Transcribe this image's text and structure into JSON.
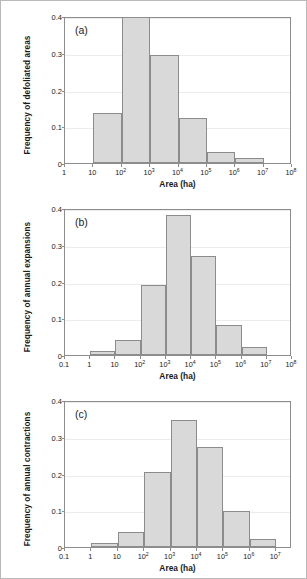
{
  "figure": {
    "background": "#ffffff",
    "frame_color": "#b9b9b9",
    "bar_fill": "#d9d9d9",
    "bar_stroke": "#8c8c8c",
    "axis_color": "#8d8d8d",
    "grid_color": "#ececec"
  },
  "chart_data": [
    {
      "type": "bar",
      "panel": "(a)",
      "title": "",
      "xlabel": "Area (ha)",
      "ylabel": "Frequency of defoliated areas",
      "xscale": "log",
      "xtick_labels": [
        "1",
        "10",
        "10²",
        "10³",
        "10⁴",
        "10⁵",
        "10⁶",
        "10⁷",
        "10⁸"
      ],
      "xtick_bases": [
        "1",
        "10",
        "10",
        "10",
        "10",
        "10",
        "10",
        "10",
        "10"
      ],
      "xtick_exponents": [
        "",
        "",
        "2",
        "3",
        "4",
        "5",
        "6",
        "7",
        "8"
      ],
      "xtick_values": [
        0,
        1,
        2,
        3,
        4,
        5,
        6,
        7,
        8
      ],
      "xlim_exp": [
        0,
        8
      ],
      "ytick_labels": [
        "0",
        "0.1",
        "0.2",
        "0.3",
        "0.4"
      ],
      "ytick_values": [
        0,
        0.1,
        0.2,
        0.3,
        0.4
      ],
      "ylim": [
        0,
        0.4
      ],
      "grid": true,
      "legend": "none",
      "bins_exp": [
        [
          1,
          2
        ],
        [
          2,
          3
        ],
        [
          3,
          4
        ],
        [
          4,
          5
        ],
        [
          5,
          6
        ],
        [
          6,
          7
        ]
      ],
      "bin_labels": [
        "10–10²",
        "10²–10³",
        "10³–10⁴",
        "10⁴–10⁵",
        "10⁵–10⁶",
        "10⁶–10⁷"
      ],
      "values": [
        0.135,
        0.4,
        0.293,
        0.123,
        0.031,
        0.013
      ]
    },
    {
      "type": "bar",
      "panel": "(b)",
      "title": "",
      "xlabel": "Area (ha)",
      "ylabel": "Frequency of annual expansions",
      "xscale": "log",
      "xtick_labels": [
        "0.1",
        "1",
        "10",
        "10²",
        "10³",
        "10⁴",
        "10⁵",
        "10⁶",
        "10⁷",
        "10⁸"
      ],
      "xtick_bases": [
        "0.1",
        "1",
        "10",
        "10",
        "10",
        "10",
        "10",
        "10",
        "10",
        "10"
      ],
      "xtick_exponents": [
        "",
        "",
        "",
        "2",
        "3",
        "4",
        "5",
        "6",
        "7",
        "8"
      ],
      "xtick_values": [
        -1,
        0,
        1,
        2,
        3,
        4,
        5,
        6,
        7,
        8
      ],
      "xlim_exp": [
        -1,
        8
      ],
      "ytick_labels": [
        "0",
        "0.1",
        "0.2",
        "0.3",
        "0.4"
      ],
      "ytick_values": [
        0,
        0.1,
        0.2,
        0.3,
        0.4
      ],
      "ylim": [
        0,
        0.4
      ],
      "grid": true,
      "legend": "none",
      "bins_exp": [
        [
          0,
          1
        ],
        [
          1,
          2
        ],
        [
          2,
          3
        ],
        [
          3,
          4
        ],
        [
          4,
          5
        ],
        [
          5,
          6
        ],
        [
          6,
          7
        ]
      ],
      "bin_labels": [
        "1–10",
        "10–10²",
        "10²–10³",
        "10³–10⁴",
        "10⁴–10⁵",
        "10⁵–10⁶",
        "10⁶–10⁷"
      ],
      "values": [
        0.011,
        0.04,
        0.19,
        0.381,
        0.27,
        0.081,
        0.021
      ]
    },
    {
      "type": "bar",
      "panel": "(c)",
      "title": "",
      "xlabel": "Area (ha)",
      "ylabel": "Frequency of annual contractions",
      "xscale": "log",
      "xtick_labels": [
        "0.1",
        "1",
        "10",
        "10²",
        "10³",
        "10⁴",
        "10⁵",
        "10⁶",
        "10⁷"
      ],
      "xtick_bases": [
        "0.1",
        "1",
        "10",
        "10",
        "10",
        "10",
        "10",
        "10",
        "10"
      ],
      "xtick_exponents": [
        "",
        "",
        "",
        "2",
        "3",
        "4",
        "5",
        "6",
        "7"
      ],
      "xtick_values": [
        -1,
        0,
        1,
        2,
        3,
        4,
        5,
        6,
        7
      ],
      "xlim_exp": [
        -1,
        7.6
      ],
      "ytick_labels": [
        "0",
        "0.1",
        "0.2",
        "0.3",
        "0.4"
      ],
      "ytick_values": [
        0,
        0.1,
        0.2,
        0.3,
        0.4
      ],
      "ylim": [
        0,
        0.4
      ],
      "grid": true,
      "legend": "none",
      "bins_exp": [
        [
          0,
          1
        ],
        [
          1,
          2
        ],
        [
          2,
          3
        ],
        [
          3,
          4
        ],
        [
          4,
          5
        ],
        [
          5,
          6
        ],
        [
          6,
          7
        ]
      ],
      "bin_labels": [
        "1–10",
        "10–10²",
        "10²–10³",
        "10³–10⁴",
        "10⁴–10⁵",
        "10⁵–10⁶",
        "10⁶–10⁷"
      ],
      "values": [
        0.011,
        0.042,
        0.205,
        0.345,
        0.272,
        0.098,
        0.021
      ]
    }
  ]
}
